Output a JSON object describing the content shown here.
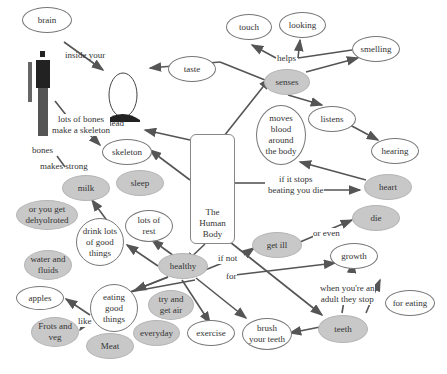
{
  "colors": {
    "grey_node": "#c8c8c8",
    "white_node": "#ffffff",
    "line": "#555555"
  },
  "central": {
    "label_lines": [
      "The",
      "Human",
      "Body"
    ]
  },
  "nodes": {
    "brain": "brain",
    "head": "head",
    "skeleton": "skeleton",
    "bones": "bones",
    "taste": "taste",
    "touch": "touch",
    "looking": "looking",
    "smelling": "smelling",
    "senses": "senses",
    "listens": "listens",
    "hearing": "hearing",
    "moves_blood": [
      "moves",
      "blood",
      "around",
      "the body"
    ],
    "heart": "heart",
    "die": "die",
    "get_ill": "get ill",
    "growth": "growth",
    "for_eating": "for eating",
    "teeth": "teeth",
    "brush": [
      "brush",
      "your teeth"
    ],
    "exercise": "exercise",
    "everyday": "everyday",
    "try_air": [
      "try and",
      "get air"
    ],
    "meat": "Meat",
    "frots": [
      "Frots and",
      "veg"
    ],
    "apples": "apples",
    "eating": [
      "eating",
      "good",
      "things"
    ],
    "water": [
      "water and",
      "fluids"
    ],
    "drink": [
      "drink lots",
      "of good",
      "things"
    ],
    "dehydrated": [
      "or you get",
      "dehyolroted"
    ],
    "milk": "milk",
    "sleep": "sleep",
    "rest": [
      "lots of",
      "rest"
    ],
    "healthy": "healthy"
  },
  "links": {
    "inside_your": "inside your",
    "lots_of_bones": [
      "lots of bones",
      "make a skeleton"
    ],
    "makes_strong": "makes strong",
    "helps": "helps",
    "if_stops": [
      "if it stops",
      "beating you die"
    ],
    "or_even": "or even",
    "if_not": "if not",
    "for": "for",
    "adult": [
      "when you're an",
      "adult they stop"
    ],
    "like": "like"
  }
}
